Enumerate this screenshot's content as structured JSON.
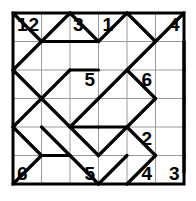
{
  "puzzle": {
    "name": "slalom-grid-puzzle",
    "type": "slalom",
    "grid_cols": 6,
    "grid_rows": 6,
    "colors": {
      "background": "#ffffff",
      "border": "#000000",
      "gridline": "#9a9a9a",
      "path": "#000000",
      "text": "#000000"
    },
    "geometry": {
      "origin_x": 13,
      "origin_y": 13,
      "cell": 28.5,
      "border_width": 3,
      "gridline_width": 1,
      "path_width": 3.2
    },
    "clues": [
      {
        "label": "1",
        "col": 0,
        "row": 0,
        "dx": 9,
        "dy": 12
      },
      {
        "label": "2",
        "col": 1,
        "row": 0,
        "dx": -8,
        "dy": 12
      },
      {
        "label": "3",
        "col": 2,
        "row": 0,
        "dx": 8,
        "dy": 12
      },
      {
        "label": "1",
        "col": 3,
        "row": 0,
        "dx": 9,
        "dy": 12
      },
      {
        "label": "4",
        "col": 6,
        "row": 0,
        "dx": -10,
        "dy": 12
      },
      {
        "label": "5",
        "col": 3,
        "row": 2,
        "dx": -9,
        "dy": 10
      },
      {
        "label": "6",
        "col": 5,
        "row": 2,
        "dx": -9,
        "dy": 10
      },
      {
        "label": "2",
        "col": 5,
        "row": 4,
        "dx": -9,
        "dy": 12
      },
      {
        "label": "6",
        "col": 0,
        "row": 6,
        "dx": 9,
        "dy": -10
      },
      {
        "label": "5",
        "col": 3,
        "row": 6,
        "dx": -9,
        "dy": -10
      },
      {
        "label": "4",
        "col": 5,
        "row": 6,
        "dx": -9,
        "dy": -10
      },
      {
        "label": "3",
        "col": 6,
        "row": 6,
        "dx": -10,
        "dy": -10
      }
    ],
    "diagonals": [
      {
        "col": 0,
        "row": 0,
        "dir": "\\"
      },
      {
        "col": 1,
        "row": 0,
        "dir": "/"
      },
      {
        "col": 2,
        "row": 0,
        "dir": "\\"
      },
      {
        "col": 3,
        "row": 0,
        "dir": "/"
      },
      {
        "col": 4,
        "row": 0,
        "dir": "\\"
      },
      {
        "col": 5,
        "row": 0,
        "dir": "/"
      },
      {
        "col": 0,
        "row": 1,
        "dir": "/"
      },
      {
        "col": 1,
        "row": 1,
        "dir": "none"
      },
      {
        "col": 2,
        "row": 1,
        "dir": "none"
      },
      {
        "col": 3,
        "row": 1,
        "dir": "none"
      },
      {
        "col": 4,
        "row": 1,
        "dir": "/"
      },
      {
        "col": 5,
        "row": 1,
        "dir": "none"
      },
      {
        "col": 0,
        "row": 2,
        "dir": "\\"
      },
      {
        "col": 1,
        "row": 2,
        "dir": "/"
      },
      {
        "col": 2,
        "row": 2,
        "dir": "none"
      },
      {
        "col": 3,
        "row": 2,
        "dir": "/"
      },
      {
        "col": 4,
        "row": 2,
        "dir": "\\"
      },
      {
        "col": 5,
        "row": 2,
        "dir": "none"
      },
      {
        "col": 0,
        "row": 3,
        "dir": "/"
      },
      {
        "col": 1,
        "row": 3,
        "dir": "\\"
      },
      {
        "col": 2,
        "row": 3,
        "dir": "/"
      },
      {
        "col": 3,
        "row": 3,
        "dir": "none"
      },
      {
        "col": 4,
        "row": 3,
        "dir": "/"
      },
      {
        "col": 5,
        "row": 3,
        "dir": "none"
      },
      {
        "col": 0,
        "row": 4,
        "dir": "\\"
      },
      {
        "col": 1,
        "row": 4,
        "dir": "\\"
      },
      {
        "col": 2,
        "row": 4,
        "dir": "\\"
      },
      {
        "col": 3,
        "row": 4,
        "dir": "/"
      },
      {
        "col": 4,
        "row": 4,
        "dir": "\\"
      },
      {
        "col": 5,
        "row": 4,
        "dir": "none"
      },
      {
        "col": 0,
        "row": 5,
        "dir": "/"
      },
      {
        "col": 1,
        "row": 5,
        "dir": "none"
      },
      {
        "col": 2,
        "row": 5,
        "dir": "\\"
      },
      {
        "col": 3,
        "row": 5,
        "dir": "/"
      },
      {
        "col": 4,
        "row": 5,
        "dir": "/"
      },
      {
        "col": 5,
        "row": 5,
        "dir": "none"
      }
    ],
    "connectors": [
      {
        "from": [
          1.0,
          1.0
        ],
        "to": [
          2.0,
          1.0
        ]
      },
      {
        "from": [
          2.0,
          1.0
        ],
        "to": [
          3.0,
          1.0
        ]
      },
      {
        "from": [
          2.0,
          2.0
        ],
        "to": [
          3.0,
          2.0
        ]
      },
      {
        "from": [
          2.0,
          4.0
        ],
        "to": [
          3.0,
          4.0
        ]
      },
      {
        "from": [
          3.0,
          4.0
        ],
        "to": [
          4.0,
          4.0
        ]
      },
      {
        "from": [
          1.0,
          5.0
        ],
        "to": [
          2.0,
          5.0
        ]
      },
      {
        "from": [
          6.0,
          1.0
        ],
        "to": [
          6.0,
          2.0
        ]
      },
      {
        "from": [
          6.0,
          2.0
        ],
        "to": [
          6.0,
          3.0
        ]
      },
      {
        "from": [
          6.0,
          3.0
        ],
        "to": [
          6.0,
          4.0
        ]
      },
      {
        "from": [
          6.0,
          4.0
        ],
        "to": [
          6.0,
          5.0
        ]
      },
      {
        "from": [
          6.0,
          5.0
        ],
        "to": [
          6.0,
          5.6
        ]
      }
    ]
  }
}
